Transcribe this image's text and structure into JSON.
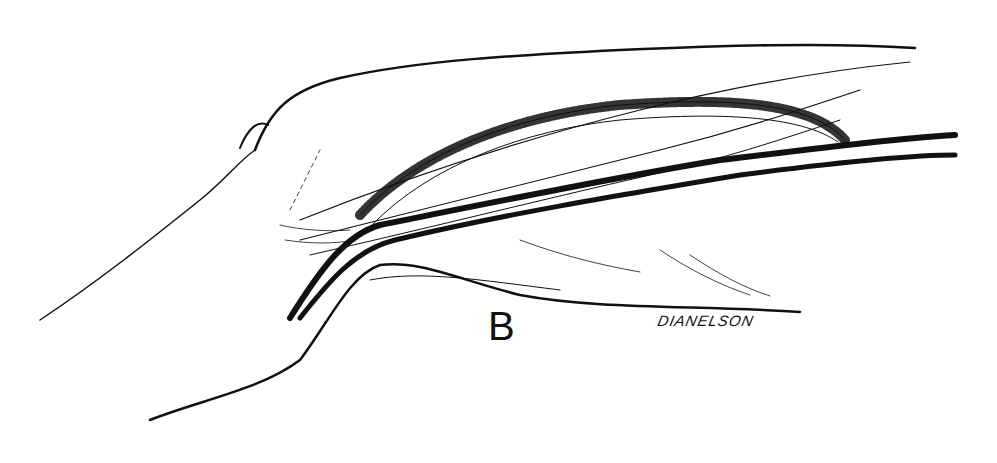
{
  "figure": {
    "panel_label": "B",
    "signature": "DIANELSON",
    "colors": {
      "ink": "#111111",
      "paper": "#ffffff"
    }
  }
}
